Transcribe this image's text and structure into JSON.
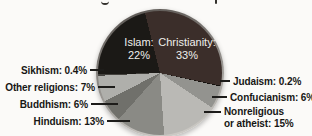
{
  "figure": {
    "background_color": "#fbfaf8",
    "clipped_title_descenders": [
      "g",
      "p"
    ]
  },
  "chart_data": {
    "type": "pie",
    "legend_position": "callout-labels",
    "start_angle_deg": -14,
    "callout_label_color": "#171715",
    "inside_label_color": "#efeeec",
    "slices": [
      {
        "name": "Christianity",
        "value": 33,
        "percent_label": "33%",
        "color": "#3b2e2a",
        "label_style": "inside",
        "label_lines": [
          "Christianity:",
          "33%"
        ]
      },
      {
        "name": "Judaism",
        "value": 0.2,
        "percent_label": "0.2%",
        "color": "#15120f",
        "label_style": "callout-right",
        "label_lines": [
          "Judaism: 0.2%"
        ]
      },
      {
        "name": "Confucianism",
        "value": 6,
        "percent_label": "6%",
        "color": "#93938f",
        "label_style": "callout-right",
        "label_lines": [
          "Confucianism: 6%"
        ]
      },
      {
        "name": "Nonreligious or atheist",
        "value": 15,
        "percent_label": "15%",
        "color": "#bab9b5",
        "label_style": "callout-right",
        "label_lines": [
          "Nonreligious",
          "or atheist: 15%"
        ]
      },
      {
        "name": "Hinduism",
        "value": 13,
        "percent_label": "13%",
        "color": "#8a8a85",
        "label_style": "callout-left",
        "label_lines": [
          "Hinduism: 13%"
        ]
      },
      {
        "name": "Buddhism",
        "value": 6,
        "percent_label": "6%",
        "color": "#70706b",
        "label_style": "callout-left",
        "label_lines": [
          "Buddhism: 6%"
        ]
      },
      {
        "name": "Other religions",
        "value": 7,
        "percent_label": "7%",
        "color": "#afafab",
        "label_style": "callout-left",
        "label_lines": [
          "Other religions: 7%"
        ]
      },
      {
        "name": "Sikhism",
        "value": 0.4,
        "percent_label": "0.4%",
        "color": "#44423e",
        "label_style": "callout-left",
        "label_lines": [
          "Sikhism: 0.4%"
        ]
      },
      {
        "name": "Islam",
        "value": 22,
        "percent_label": "22%",
        "color": "#1b1916",
        "label_style": "inside",
        "label_lines": [
          "Islam:",
          "22%"
        ]
      }
    ]
  }
}
